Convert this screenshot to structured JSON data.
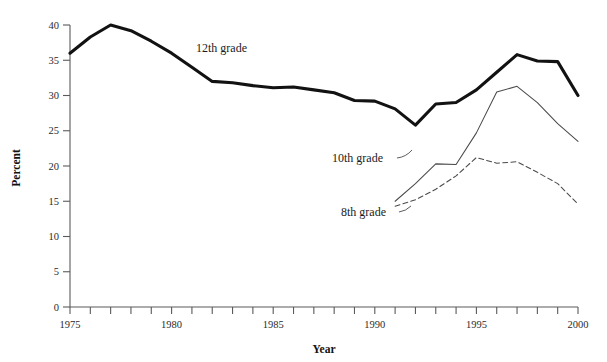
{
  "chart_data": {
    "type": "line",
    "title": "",
    "xlabel": "Year",
    "ylabel": "Percent",
    "xlim": [
      1975,
      2000
    ],
    "ylim": [
      0,
      40
    ],
    "ytick_step": 5,
    "xtick_step": 1,
    "xtick_label_step": 5,
    "grid": false,
    "legend_position": "inline-annotations",
    "x": [
      1975,
      1976,
      1977,
      1978,
      1979,
      1980,
      1981,
      1982,
      1983,
      1984,
      1985,
      1986,
      1987,
      1988,
      1989,
      1990,
      1991,
      1992,
      1993,
      1994,
      1995,
      1996,
      1997,
      1998,
      1999,
      2000
    ],
    "series": [
      {
        "name": "12th grade",
        "style": "thick-solid",
        "color": "#121212",
        "x": [
          1975,
          1976,
          1977,
          1978,
          1979,
          1980,
          1981,
          1982,
          1983,
          1984,
          1985,
          1986,
          1987,
          1988,
          1989,
          1990,
          1991,
          1992,
          1993,
          1994,
          1995,
          1996,
          1997,
          1998,
          1999,
          2000
        ],
        "values": [
          36.0,
          38.3,
          40.0,
          39.2,
          37.7,
          36.0,
          34.0,
          32.0,
          31.8,
          31.4,
          31.1,
          31.2,
          30.8,
          30.4,
          29.3,
          29.2,
          28.1,
          25.8,
          28.8,
          29.0,
          30.8,
          33.3,
          35.8,
          34.9,
          34.8,
          30.0
        ]
      },
      {
        "name": "10th grade",
        "style": "thin-solid",
        "color": "#4a4a4a",
        "x": [
          1991,
          1992,
          1993,
          1994,
          1995,
          1996,
          1997,
          1998,
          1999,
          2000
        ],
        "values": [
          15.0,
          17.5,
          20.3,
          20.2,
          24.7,
          30.5,
          31.3,
          29.0,
          26.0,
          23.5
        ]
      },
      {
        "name": "8th grade",
        "style": "dashed",
        "color": "#4a4a4a",
        "x": [
          1991,
          1992,
          1993,
          1994,
          1995,
          1996,
          1997,
          1998,
          1999,
          2000
        ],
        "values": [
          14.3,
          15.2,
          16.7,
          18.6,
          21.2,
          20.4,
          20.6,
          19.1,
          17.5,
          14.6
        ]
      }
    ],
    "annotations": [
      {
        "text": "12th grade",
        "x_px": 196,
        "y_px": 52
      },
      {
        "text": "10th grade",
        "x_px": 332,
        "y_px": 162
      },
      {
        "text": "8th grade",
        "x_px": 341,
        "y_px": 216
      }
    ],
    "ytick_labels": [
      "0",
      "5",
      "10",
      "15",
      "20",
      "25",
      "30",
      "35",
      "40"
    ],
    "xtick_labels": [
      "1975",
      "1980",
      "1985",
      "1990",
      "1995",
      "2000"
    ]
  }
}
